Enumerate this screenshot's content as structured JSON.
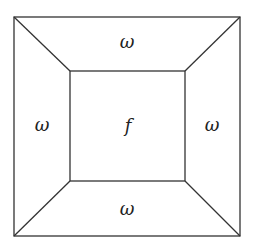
{
  "diagram": {
    "regions": {
      "center": "f",
      "top": "ω",
      "bottom": "ω",
      "left": "ω",
      "right": "ω"
    },
    "line_color": "#333333"
  }
}
